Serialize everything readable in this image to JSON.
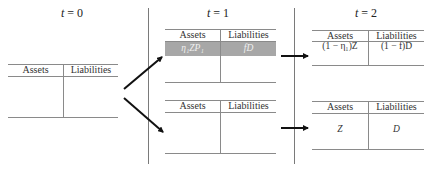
{
  "periods": [
    {
      "label_var": "t",
      "label_eq": " = ",
      "label_num": "0"
    },
    {
      "label_var": "t",
      "label_eq": " = ",
      "label_num": "1"
    },
    {
      "label_var": "t",
      "label_eq": " = ",
      "label_num": "2"
    }
  ],
  "tables": {
    "t0": {
      "assets_header": "Assets",
      "liabilities_header": "Liabilities",
      "assets_value": "",
      "liabilities_value": ""
    },
    "t1_top": {
      "assets_header": "Assets",
      "liabilities_header": "Liabilities",
      "assets_value": "η₁ZP₁",
      "liabilities_value": "fD",
      "highlighted_row": true
    },
    "t1_bottom": {
      "assets_header": "Assets",
      "liabilities_header": "Liabilities",
      "assets_value": "",
      "liabilities_value": ""
    },
    "t2_top": {
      "assets_header": "Assets",
      "liabilities_header": "Liabilities",
      "assets_value": "(1 − η₁)Z",
      "liabilities_value": "(1 − f)D"
    },
    "t2_bottom": {
      "assets_header": "Assets",
      "liabilities_header": "Liabilities",
      "assets_value": "Z",
      "liabilities_value": "D"
    }
  },
  "colors": {
    "highlight": "#a7a7a7",
    "lines": "#8a8a8a",
    "arrows": "#111111"
  }
}
